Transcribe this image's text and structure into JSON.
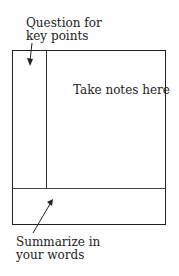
{
  "diagram": {
    "type": "cornell-notes-layout",
    "labels": {
      "cue_column": [
        "Question for",
        "key points"
      ],
      "notes_area": "Take notes here",
      "summary_area": [
        "Summarize in",
        "your words"
      ]
    },
    "colors": {
      "stroke": "#222222",
      "background": "#ffffff"
    }
  }
}
